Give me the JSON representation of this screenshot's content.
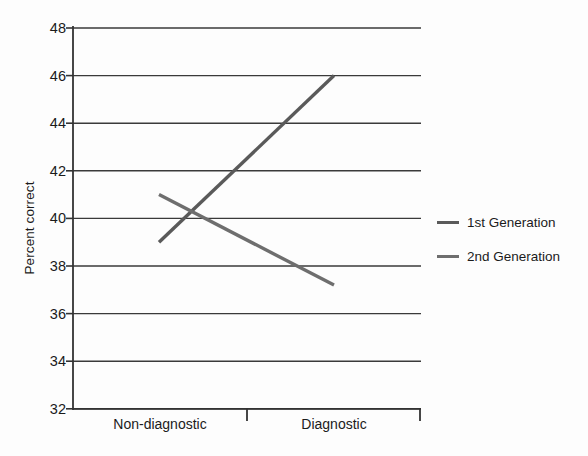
{
  "chart_data": {
    "type": "line",
    "title": "",
    "xlabel": "",
    "ylabel": "Percent correct",
    "categories": [
      "Non-diagnostic",
      "Diagnostic"
    ],
    "ylim": [
      32,
      48
    ],
    "yticks": [
      32,
      34,
      36,
      38,
      40,
      42,
      44,
      46,
      48
    ],
    "ytick_labels": [
      "32",
      "34",
      "36",
      "38",
      "40",
      "42",
      "44",
      "46",
      "48"
    ],
    "grid": "horizontal",
    "legend_position": "right",
    "series": [
      {
        "name": "1st Generation",
        "values": [
          39,
          46
        ],
        "color": "#5a5a5a"
      },
      {
        "name": "2nd Generation",
        "values": [
          41,
          37.2
        ],
        "color": "#6e6e6e"
      }
    ]
  },
  "legend": {
    "items": [
      {
        "label": "1st Generation"
      },
      {
        "label": "2nd Generation"
      }
    ]
  },
  "axes": {
    "y_title": "Percent correct",
    "y_labels": [
      "48",
      "46",
      "44",
      "42",
      "40",
      "38",
      "36",
      "34",
      "32"
    ],
    "x_labels": [
      "Non-diagnostic",
      "Diagnostic"
    ]
  },
  "colors": {
    "background": "#fdfdfd",
    "axis": "#333333",
    "grid": "#3a3a3a",
    "series_1": "#5a5a5a",
    "series_2": "#6e6e6e",
    "text": "#1b1b1b"
  }
}
